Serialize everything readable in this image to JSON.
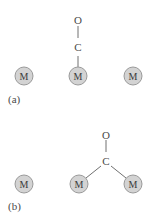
{
  "panels": [
    {
      "label": "(a)",
      "metals": [
        "M",
        "M",
        "M"
      ],
      "ligand": {
        "carbon": "C",
        "oxygen": "O"
      },
      "binding": "terminal"
    },
    {
      "label": "(b)",
      "metals": [
        "M",
        "M",
        "M"
      ],
      "ligand": {
        "carbon": "C",
        "oxygen": "O"
      },
      "binding": "bridging"
    }
  ],
  "colors": {
    "metal_fill": "#d3d3d3",
    "metal_stroke": "#9a9a9a",
    "bond": "#707070",
    "text": "#4a4a4a"
  }
}
